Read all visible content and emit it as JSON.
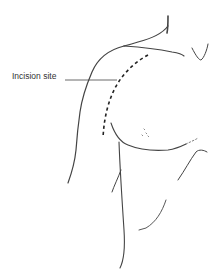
{
  "figure": {
    "line_color": "#444444",
    "annotations": [
      {
        "label": "Incision site",
        "target": "dashed-incision-line"
      }
    ]
  }
}
